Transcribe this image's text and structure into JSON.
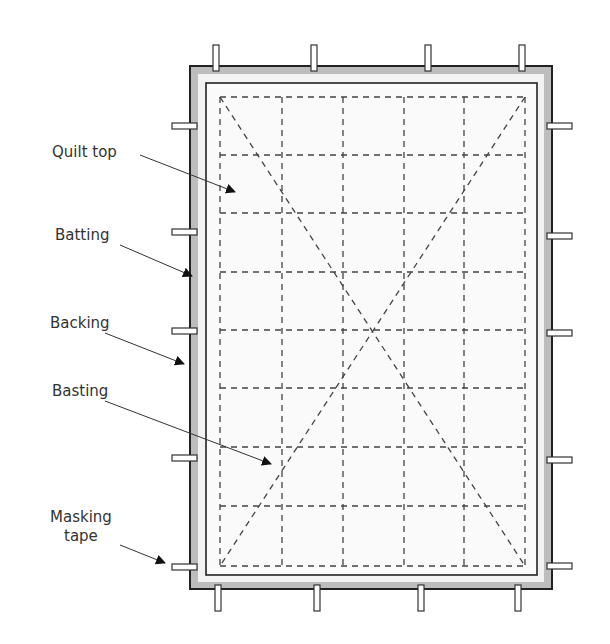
{
  "diagram": {
    "type": "quilt-basting-diagram",
    "colors": {
      "background": "#ffffff",
      "backing_fill": "#bdbdbd",
      "batting_fill": "#f2f2f2",
      "quilt_top_fill": "#fafafa",
      "outline": "#222222",
      "dash": "#444444",
      "text": "#333333",
      "tape_fill": "#ffffff"
    },
    "backing": {
      "x": 190,
      "y": 66,
      "w": 362,
      "h": 523
    },
    "batting": {
      "x": 198,
      "y": 74,
      "w": 346,
      "h": 508
    },
    "quilt_top": {
      "x": 206,
      "y": 83,
      "w": 331,
      "h": 492
    },
    "basting_grid": {
      "x": [
        220,
        282,
        343,
        404,
        464,
        525
      ],
      "y": [
        97,
        155,
        213,
        272,
        330,
        388,
        447,
        506,
        566
      ]
    },
    "basting_diagonals": [
      {
        "x1": 220,
        "y1": 97,
        "x2": 525,
        "y2": 566
      },
      {
        "x1": 525,
        "y1": 97,
        "x2": 220,
        "y2": 566
      }
    ],
    "tapes": {
      "top": [
        216,
        314,
        428,
        522
      ],
      "bottom": [
        218,
        317,
        421,
        518
      ],
      "left": [
        126,
        232,
        331,
        458,
        567
      ],
      "right": [
        126,
        236,
        333,
        460,
        566
      ]
    },
    "labels": [
      {
        "id": "quilt-top",
        "text": "Quilt top",
        "x": 52,
        "y": 152,
        "arrow": {
          "x1": 140,
          "y1": 155,
          "x2": 235,
          "y2": 192
        }
      },
      {
        "id": "batting",
        "text": "Batting",
        "x": 55,
        "y": 235,
        "arrow": {
          "x1": 120,
          "y1": 245,
          "x2": 192,
          "y2": 276
        }
      },
      {
        "id": "backing",
        "text": "Backing",
        "x": 50,
        "y": 322,
        "arrow": {
          "x1": 105,
          "y1": 333,
          "x2": 184,
          "y2": 364
        }
      },
      {
        "id": "basting",
        "text": "Basting",
        "x": 52,
        "y": 391,
        "arrow": {
          "x1": 105,
          "y1": 401,
          "x2": 271,
          "y2": 464
        }
      },
      {
        "id": "masking-tape",
        "text": "Masking\ntape",
        "x": 50,
        "y": 507,
        "arrow": {
          "x1": 120,
          "y1": 545,
          "x2": 165,
          "y2": 563
        }
      }
    ],
    "label_text": {
      "quilt_top": "Quilt top",
      "batting": "Batting",
      "backing": "Backing",
      "basting": "Basting",
      "masking_line1": "Masking",
      "masking_line2": "tape"
    }
  }
}
